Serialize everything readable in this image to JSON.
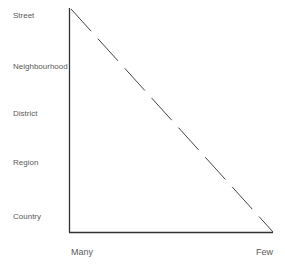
{
  "diagram": {
    "y_axis_labels": [
      "Street",
      "Neighbourhood",
      "District",
      "Region",
      "Country"
    ],
    "x_axis_labels": {
      "left": "Many",
      "right": "Few"
    },
    "line": {
      "style": "dashed",
      "from": "top-left (Street, Many)",
      "to": "bottom-right (Country, Few)"
    },
    "colors": {
      "axis": "#333333",
      "line": "#444444",
      "text": "#5a5a5a",
      "background": "#ffffff"
    }
  }
}
